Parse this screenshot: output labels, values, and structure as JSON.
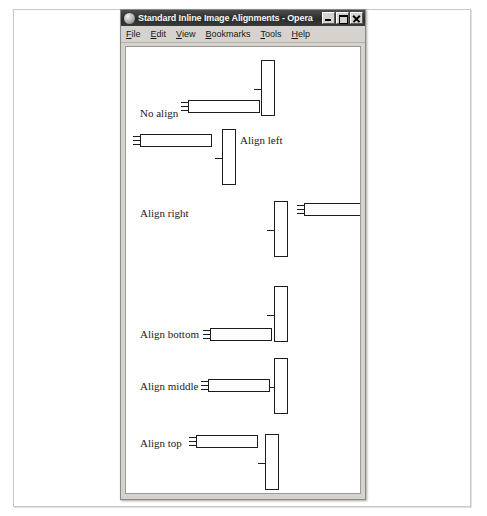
{
  "window": {
    "title": "Standard Inline Image Alignments - Opera",
    "app_icon": "opera-logo-icon",
    "controls": {
      "minimize": "minimize-button",
      "maximize": "maximize-button",
      "close": "close-button"
    },
    "menu": [
      {
        "label": "File",
        "accelerator": "F"
      },
      {
        "label": "Edit",
        "accelerator": "E"
      },
      {
        "label": "View",
        "accelerator": "V"
      },
      {
        "label": "Bookmarks",
        "accelerator": "B"
      },
      {
        "label": "Tools",
        "accelerator": "T"
      },
      {
        "label": "Help",
        "accelerator": "H"
      }
    ]
  },
  "page": {
    "labels": {
      "no_align": "No align",
      "align_left": "Align left",
      "align_right": "Align right",
      "align_bottom": "Align bottom",
      "align_middle": "Align middle",
      "align_top": "Align top"
    },
    "placeholders": {
      "kind": "broken-image-placeholder",
      "horizontal_count": 6,
      "vertical_count": 6
    }
  },
  "colors": {
    "title_bar": "#2b2b2b",
    "title_text": "#f6f6f6",
    "chrome": "#d6d3ce",
    "page_background": "#ffffff",
    "placeholder_outline": "#1c1c1c",
    "page_frame_border": "#c8c8c8"
  }
}
